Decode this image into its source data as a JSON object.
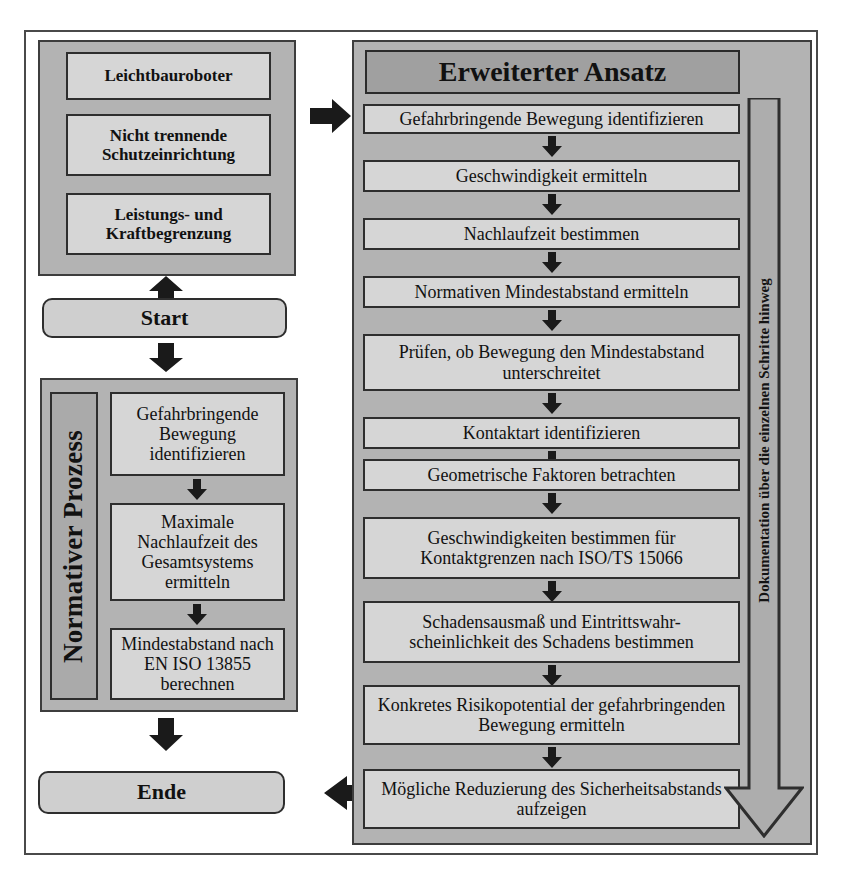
{
  "diagram": {
    "title": "Erweiterter Ansatz",
    "left_column": {
      "preconditions_panel": {
        "items": [
          "Leichtbauroboter",
          "Nicht trennende Schutzeinrichtung",
          "Leistungs- und Kraftbegrenzung"
        ]
      },
      "start_label": "Start",
      "normative_panel": {
        "side_label": "Normativer Prozess",
        "steps": [
          "Gefahrbringende Bewegung identifizieren",
          "Maximale Nachlaufzeit des Gesamtsystems ermitteln",
          "Mindestabstand nach EN ISO 13855 berechnen"
        ]
      },
      "end_label": "Ende"
    },
    "right_column": {
      "header": "Erweiterter Ansatz",
      "steps": [
        "Gefahrbringende Bewegung identifizieren",
        "Geschwindigkeit ermitteln",
        "Nachlaufzeit bestimmen",
        "Normativen Mindestabstand ermitteln",
        "Prüfen, ob Bewegung den Mindestabstand unterschreitet",
        "Kontaktart identifizieren",
        "Geometrische Faktoren betrachten",
        "Geschwindigkeiten bestimmen für Kontaktgrenzen nach ISO/TS 15066",
        "Schadensausmaß und Eintrittswahr-scheinlichkeit des Schadens bestimmen",
        "Konkretes Risikopotential der gefahrbringenden Bewegung ermitteln",
        "Mögliche Reduzierung des Sicherheitsabstands aufzeigen"
      ],
      "documentation_arrow_label": "Dokumentation über die einzelnen Schritte hinweg"
    },
    "connectors": {
      "precondition_to_right": "arrow-right",
      "start_up": "arrow-up",
      "start_down": "arrow-down",
      "normative_to_end": "arrow-down",
      "right_to_end": "arrow-left"
    },
    "colors": {
      "panel_fill": "#b3b3b3",
      "box_fill": "#d6d6d6",
      "header_fill": "#a0a0a0",
      "border": "#2e2e2e",
      "arrow": "#1a1a1a"
    }
  }
}
